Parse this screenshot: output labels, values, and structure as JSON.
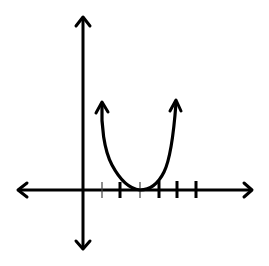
{
  "diagram": {
    "type": "coordinate-graph",
    "colors": {
      "stroke": "#000000",
      "background": "#ffffff",
      "thin_tick": "#444444"
    },
    "axes": {
      "origin": {
        "x": 83,
        "y": 190
      },
      "x_axis": {
        "from": 17,
        "to": 253,
        "y": 190,
        "arrows": "both"
      },
      "y_axis": {
        "from": 16,
        "to": 250,
        "x": 83,
        "arrows": "both"
      },
      "ticks": [
        {
          "x": 102,
          "style": "thin",
          "unit": 1
        },
        {
          "x": 120,
          "style": "thick",
          "unit": 2
        },
        {
          "x": 140,
          "style": "thin",
          "unit": 3
        },
        {
          "x": 159,
          "style": "thick",
          "unit": 4
        },
        {
          "x": 177,
          "style": "thick",
          "unit": 5
        },
        {
          "x": 196,
          "style": "thick",
          "unit": 6
        }
      ]
    },
    "curve": {
      "shape": "parabola-up",
      "vertex": {
        "x": 140,
        "y": 190,
        "unit_x": 3
      },
      "left_arrow_tip": {
        "x": 102,
        "y": 101
      },
      "right_arrow_tip": {
        "x": 176,
        "y": 100
      },
      "arrows": "both-ends"
    }
  }
}
